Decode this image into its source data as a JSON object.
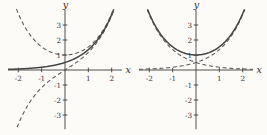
{
  "figure": {
    "background": "#fcfbf8",
    "colors": {
      "axis": "#3d3d3d",
      "solid_curve": "#454545",
      "dashed_curve": "#575757",
      "tick_label": "#333333",
      "axis_label": "#2e2e2e"
    }
  },
  "chart_data": [
    {
      "type": "line",
      "title": "",
      "xlabel": "x",
      "ylabel": "y",
      "xlim": [
        -2.44,
        2.44
      ],
      "ylim": [
        -3.95,
        4.0
      ],
      "xticks": [
        -2,
        -1,
        1,
        2
      ],
      "yticks": [
        -3,
        -2,
        -1,
        1,
        2,
        3
      ],
      "grid": false,
      "legend": "none",
      "series": [
        {
          "fn": "sinh(x)",
          "style": "dashed",
          "domain": [
            -2.05,
            2.16
          ]
        },
        {
          "fn": "cosh(x)",
          "style": "dashed",
          "domain": [
            -2.08,
            2.14
          ]
        },
        {
          "fn": "0.5*exp(x)",
          "style": "solid",
          "domain": [
            -2.44,
            2.12
          ]
        }
      ]
    },
    {
      "type": "line",
      "title": "",
      "xlabel": "x",
      "ylabel": "y",
      "xlim": [
        -2.44,
        2.44
      ],
      "ylim": [
        -3.95,
        4.0
      ],
      "xticks": [
        -2,
        -1,
        1,
        2
      ],
      "yticks": [
        -3,
        -2,
        -1,
        1,
        2,
        3
      ],
      "grid": false,
      "legend": "none",
      "series": [
        {
          "fn": "0.5*exp(x)",
          "style": "dashed",
          "domain": [
            -2.44,
            2.12
          ]
        },
        {
          "fn": "0.5*exp(-x)",
          "style": "dashed",
          "domain": [
            -2.12,
            2.44
          ]
        },
        {
          "fn": "cosh(x)",
          "style": "solid",
          "domain": [
            -2.1,
            2.1
          ]
        }
      ]
    }
  ]
}
